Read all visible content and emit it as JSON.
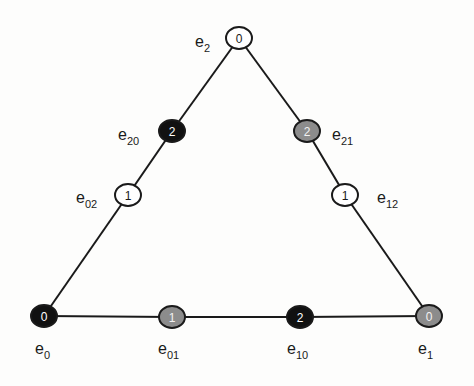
{
  "diagram": {
    "type": "triangle-graph",
    "colors": {
      "white": {
        "fill": "#ffffff",
        "text": "#1a1a1a"
      },
      "gray": {
        "fill": "#8c8c8c",
        "text": "#f2f2f2"
      },
      "black": {
        "fill": "#111111",
        "text": "#ffffff"
      },
      "stroke": "#1a1a1a",
      "background": "#fdfdfc"
    },
    "nodes": [
      {
        "id": "e2",
        "base": "e",
        "sub": "2",
        "value": "0",
        "color": "white",
        "x": 239,
        "y": 38,
        "lx": 195,
        "ly": 47
      },
      {
        "id": "e20",
        "base": "e",
        "sub": "20",
        "value": "2",
        "color": "black",
        "x": 172,
        "y": 131,
        "lx": 118,
        "ly": 140
      },
      {
        "id": "e21",
        "base": "e",
        "sub": "21",
        "value": "2",
        "color": "gray",
        "x": 307,
        "y": 131,
        "lx": 332,
        "ly": 140
      },
      {
        "id": "e02",
        "base": "e",
        "sub": "02",
        "value": "1",
        "color": "white",
        "x": 128,
        "y": 195,
        "lx": 76,
        "ly": 203
      },
      {
        "id": "e12",
        "base": "e",
        "sub": "12",
        "value": "1",
        "color": "white",
        "x": 345,
        "y": 195,
        "lx": 377,
        "ly": 203
      },
      {
        "id": "e0",
        "base": "e",
        "sub": "0",
        "value": "0",
        "color": "black",
        "x": 44,
        "y": 316,
        "lx": 35,
        "ly": 354
      },
      {
        "id": "e01",
        "base": "e",
        "sub": "01",
        "value": "1",
        "color": "gray",
        "x": 172,
        "y": 317,
        "lx": 158,
        "ly": 354
      },
      {
        "id": "e10",
        "base": "e",
        "sub": "10",
        "value": "2",
        "color": "black",
        "x": 300,
        "y": 317,
        "lx": 287,
        "ly": 354
      },
      {
        "id": "e1",
        "base": "e",
        "sub": "1",
        "value": "0",
        "color": "gray",
        "x": 429,
        "y": 316,
        "lx": 418,
        "ly": 354
      }
    ],
    "edges": [
      [
        "e2",
        "e20"
      ],
      [
        "e20",
        "e02"
      ],
      [
        "e02",
        "e0"
      ],
      [
        "e2",
        "e21"
      ],
      [
        "e21",
        "e12"
      ],
      [
        "e12",
        "e1"
      ],
      [
        "e0",
        "e01"
      ],
      [
        "e01",
        "e10"
      ],
      [
        "e10",
        "e1"
      ]
    ],
    "node_radius": 12
  }
}
